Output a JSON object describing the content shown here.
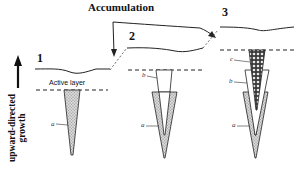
{
  "diagram": {
    "title": "Accumulation",
    "stages": [
      {
        "number": "1",
        "layer_label": "Active layer",
        "wedges": [
          "a"
        ]
      },
      {
        "number": "2",
        "wedges": [
          "a",
          "b"
        ]
      },
      {
        "number": "3",
        "wedges": [
          "a",
          "b",
          "c"
        ]
      }
    ],
    "axis_label_line1": "upward-directed",
    "axis_label_line2": "growth",
    "wedge_labels": {
      "a": "a",
      "b": "b",
      "c": "c"
    },
    "colors": {
      "line": "#222222",
      "wedge_fill_a": "#bdbdbd",
      "wedge_fill_b": "#ffffff",
      "wedge_fill_c": "#8a8a8a",
      "background": "#ffffff"
    }
  }
}
